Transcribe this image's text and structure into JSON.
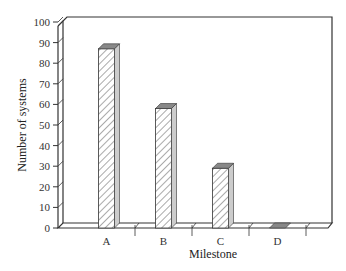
{
  "chart_data": {
    "type": "bar",
    "style": "3d-hatched",
    "title": "",
    "xlabel": "Milestone",
    "ylabel": "Number of systems",
    "categories": [
      "A",
      "B",
      "C",
      "D"
    ],
    "values": [
      87,
      58,
      29,
      0
    ],
    "ylim": [
      0,
      100
    ],
    "yticks": [
      0,
      10,
      20,
      30,
      40,
      50,
      60,
      70,
      80,
      90,
      100
    ],
    "grid": false,
    "legend": null
  },
  "colors": {
    "bar_face": "#ffffff",
    "bar_hatch": "#555555",
    "bar_top": "#888888",
    "bar_side": "#cccccc",
    "axis": "#333333"
  }
}
